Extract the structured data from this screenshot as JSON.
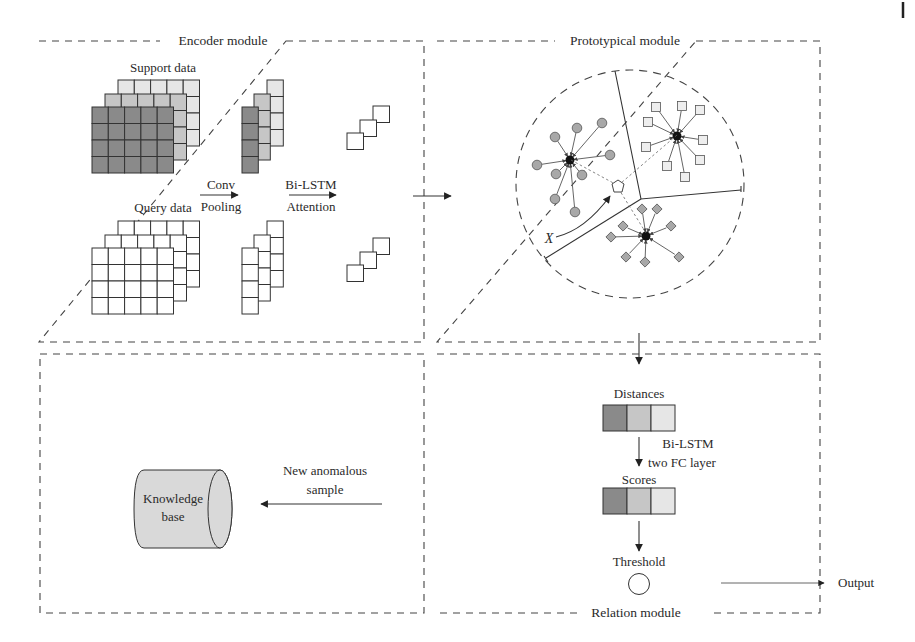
{
  "figure": {
    "modules": {
      "encoder": {
        "title": "Encoder module"
      },
      "prototypical": {
        "title": "Prototypical module"
      },
      "knowledge": {
        "title": ""
      },
      "relation": {
        "title": "Relation module"
      }
    },
    "encoder": {
      "support_label": "Support data",
      "query_label": "Query data",
      "step1_top": "Conv",
      "step1_bottom": "Pooling",
      "step2_top": "Bi-LSTM",
      "step2_bottom": "Attention"
    },
    "prototypical": {
      "query_point_label": "X"
    },
    "knowledge": {
      "db_line1": "Knowledge",
      "db_line2": "base",
      "input_line1": "New anomalous",
      "input_line2": "sample"
    },
    "relation": {
      "distances_label": "Distances",
      "step_line1": "Bi-LSTM",
      "step_line2": "two FC layer",
      "scores_label": "Scores",
      "threshold_label": "Threshold",
      "output_label": "Output"
    },
    "colors": {
      "dark_cell": "#8a8a8a",
      "mid_cell": "#c6c6c6",
      "light_cell": "#e6e6e6",
      "white_cell": "#ffffff",
      "node_gray": "#a8a8a8",
      "db_fill": "#d9d9d9"
    }
  }
}
